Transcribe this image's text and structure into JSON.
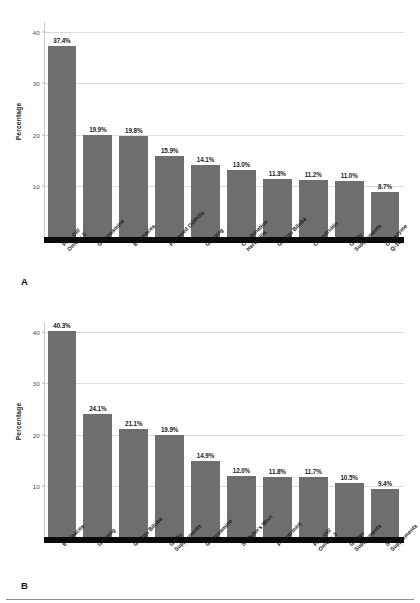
{
  "figure": {
    "panel_a_letter": "A",
    "panel_b_letter": "B"
  },
  "chart_data": [
    {
      "id": "A",
      "type": "bar",
      "title": "",
      "subtitle": "",
      "xlabel": "",
      "ylabel": "Percentage",
      "ylim": [
        0,
        42
      ],
      "yticks": [
        10,
        20,
        30,
        40
      ],
      "ytick_labels": [
        "10",
        "20",
        "30",
        "40"
      ],
      "grid": true,
      "legend": "none",
      "bar_color": "#6e6e6e",
      "categories": [
        "Fish Oil/\nOmega 3",
        "Glucosamine",
        "Echinacea",
        "Flaxseed Oil/Pills",
        "Ginseng",
        "Combination\nHerb Pills",
        "Ginkgo Biloba",
        "Chondroitin",
        "Garlic\nSupplements",
        "Coenzyme Q-10"
      ],
      "values": [
        37.4,
        19.9,
        19.8,
        15.9,
        14.1,
        13.0,
        11.3,
        11.2,
        11.0,
        8.7
      ],
      "value_labels": [
        "37.4%",
        "19.9%",
        "19.8%",
        "15.9%",
        "14.1%",
        "13.0%",
        "11.3%",
        "11.2%",
        "11.0%",
        "8.7%"
      ]
    },
    {
      "id": "B",
      "type": "bar",
      "title": "",
      "subtitle": "",
      "xlabel": "",
      "ylabel": "Percentage",
      "ylim": [
        0,
        42
      ],
      "yticks": [
        10,
        20,
        30,
        40
      ],
      "ytick_labels": [
        "10",
        "20",
        "30",
        "40"
      ],
      "grid": true,
      "legend": "none",
      "bar_color": "#6e6e6e",
      "categories": [
        "Echinacea",
        "Ginseng",
        "Ginkgo Biloba",
        "Garlic\nSupplements",
        "Glucosamine",
        "St. John's Wort",
        "Peppermint",
        "Fish Oil/\nOmega 3",
        "Ginger\nSupplements",
        "Soy Supplements"
      ],
      "values": [
        40.3,
        24.1,
        21.1,
        19.9,
        14.9,
        12.0,
        11.8,
        11.7,
        10.5,
        9.4
      ],
      "value_labels": [
        "40.3%",
        "24.1%",
        "21.1%",
        "19.9%",
        "14.9%",
        "12.0%",
        "11.8%",
        "11.7%",
        "10.5%",
        "9.4%"
      ]
    }
  ]
}
